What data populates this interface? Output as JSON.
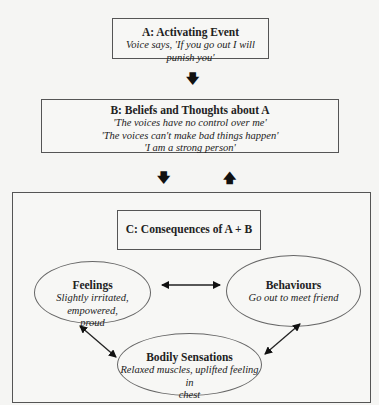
{
  "activating_event": {
    "title": "A: Activating Event",
    "text": "Voice says, 'If you go out I will punish you'"
  },
  "beliefs": {
    "title": "B: Beliefs and Thoughts about A",
    "lines": [
      "'The voices have no control over me'",
      "'The voices can't make bad things happen'",
      "'I am a strong person'"
    ]
  },
  "consequences": {
    "title": "C: Consequences of A + B",
    "feelings": {
      "title": "Feelings",
      "text_line1": "Slightly irritated, empowered,",
      "text_line2": "proud"
    },
    "behaviours": {
      "title": "Behaviours",
      "text": "Go out to meet friend"
    },
    "bodily_sensations": {
      "title": "Bodily Sensations",
      "text_line1": "Relaxed muscles, uplifted feeling in",
      "text_line2": "chest"
    }
  },
  "arrows": {
    "a_to_b": "down-arrow",
    "b_to_c": "down-arrow",
    "c_to_b": "up-arrow",
    "feelings_behaviours": "double-arrow",
    "feelings_bodily": "double-arrow",
    "behaviours_bodily": "double-arrow"
  },
  "colors": {
    "background": "#f5f5f3",
    "border": "#555555",
    "text": "#222222"
  }
}
